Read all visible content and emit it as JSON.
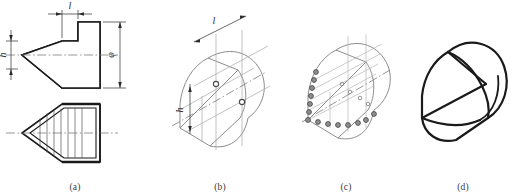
{
  "figure": {
    "panel_count": 4,
    "line_colors": {
      "outline": "#1a1a1a",
      "construction": "#9a9a9a",
      "centerline": "#6a6a6a",
      "dimension": "#2b2b2b",
      "point_marker_fill": "#8f8f8f",
      "point_marker_stroke": "#4a4a4a",
      "caption": "#3a3a3a"
    }
  },
  "panels": [
    {
      "id": "a",
      "caption": "(a)",
      "description": "Two-view orthographic drawing: top view with step profile and chamfer, front view with generatrix division lines",
      "dimensions": [
        {
          "name": "length",
          "label": "l",
          "orientation": "horizontal",
          "position": "top"
        },
        {
          "name": "height",
          "label": "h",
          "orientation": "vertical",
          "position": "left"
        },
        {
          "name": "diameter",
          "label": "φ",
          "orientation": "vertical",
          "position": "right"
        }
      ],
      "features": [
        "centerline",
        "chamfer-apex",
        "step-block",
        "division-lines"
      ]
    },
    {
      "id": "b",
      "caption": "(b)",
      "description": "Isometric axonometric box with construction lines and two located key points",
      "dimensions": [
        {
          "name": "length",
          "label": "l",
          "orientation": "isometric",
          "position": "top"
        },
        {
          "name": "height",
          "label": "h",
          "orientation": "isometric",
          "position": "left"
        }
      ],
      "marked_points": 2,
      "features": [
        "iso-axes",
        "construction-grid",
        "key-points"
      ]
    },
    {
      "id": "c",
      "caption": "(c)",
      "description": "Point series plotted along the chamfer edge and base, transferred from the orthographic views",
      "point_series": [
        {
          "name": "edge-series",
          "count": 7,
          "along": "chamfer-slope"
        },
        {
          "name": "base-series",
          "count": 7,
          "along": "base-horizontal"
        },
        {
          "name": "inner-series",
          "count": 4,
          "along": "inner-construction"
        }
      ],
      "features": [
        "plotted-points",
        "transfer-lines",
        "construction-grid"
      ]
    },
    {
      "id": "d",
      "caption": "(d)",
      "description": "Finished isometric solid with construction lines removed and outlines darkened",
      "features": [
        "final-outline",
        "chamfer-face",
        "cylindrical-surface"
      ]
    }
  ]
}
